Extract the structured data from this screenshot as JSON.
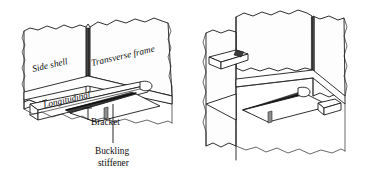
{
  "figure": {
    "domain": "engineering-line-drawing",
    "background_color": "#ffffff",
    "line_color": "#1a1a1a",
    "hatch_color": "#3a3a3a",
    "width": 368,
    "height": 175,
    "view_count": 2
  },
  "labels": {
    "side_shell": "Side shell",
    "transverse_frame": "Transverse frame",
    "longitudinal": "Longitudinal",
    "bracket": "Bracket",
    "buckling_stiffener_line1": "Buckling",
    "buckling_stiffener_line2": "stiffener"
  },
  "views": [
    {
      "name": "left-view",
      "description": "Labeled isometric cutaway showing side shell plate, transverse frame web, longitudinal stiffener, bracket and buckling stiffener",
      "labeled": true
    },
    {
      "name": "right-view",
      "description": "Unlabeled mirrored isometric cutaway of the same structural connection",
      "labeled": false
    }
  ],
  "components": [
    {
      "name": "side-shell-plate",
      "label": "Side shell"
    },
    {
      "name": "transverse-frame-web",
      "label": "Transverse frame"
    },
    {
      "name": "longitudinal-stiffener",
      "label": "Longitudinal"
    },
    {
      "name": "bracket-plate",
      "label": "Bracket"
    },
    {
      "name": "buckling-stiffener",
      "label": "Buckling stiffener"
    }
  ]
}
